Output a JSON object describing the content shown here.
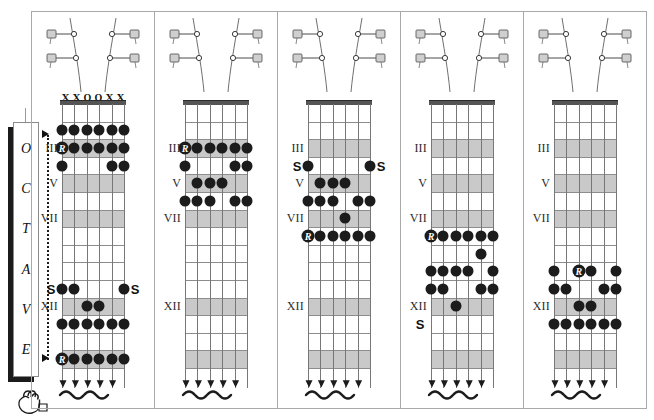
{
  "diagram": {
    "kind": "guitar-fretboard-positions",
    "octave_label": {
      "letters": [
        "O",
        "C",
        "T",
        "A",
        "V",
        "E"
      ],
      "text": "OCTAVE"
    },
    "hand_icon": "pointing-hand-icon",
    "colors": {
      "dot": "#1c1c1c",
      "band": "#c9c9c9",
      "fret": "#8d8d8d",
      "string": "#777777",
      "nut": "#555555",
      "frame": "#a9a9a9",
      "shadow": "#1b1b1b"
    },
    "string_count": 6,
    "fret_count": 15,
    "root_glyph": "R",
    "shift_glyph": "S",
    "panels": [
      {
        "id": "position-1",
        "open_markers": [
          "X",
          "X",
          "O",
          "O",
          "X",
          "X"
        ],
        "fret_numbers": [
          {
            "label": "III",
            "fret": 3
          },
          {
            "label": "V",
            "fret": 5
          },
          {
            "label": "VII",
            "fret": 7
          },
          {
            "label": "XII",
            "fret": 12
          }
        ],
        "bands": [
          3,
          5,
          7,
          12,
          15
        ],
        "dots": [
          {
            "string": 1,
            "fret": 2
          },
          {
            "string": 2,
            "fret": 2
          },
          {
            "string": 3,
            "fret": 2
          },
          {
            "string": 4,
            "fret": 2
          },
          {
            "string": 5,
            "fret": 2
          },
          {
            "string": 6,
            "fret": 2
          },
          {
            "string": 1,
            "fret": 3,
            "root": true
          },
          {
            "string": 2,
            "fret": 3
          },
          {
            "string": 3,
            "fret": 3
          },
          {
            "string": 4,
            "fret": 3
          },
          {
            "string": 5,
            "fret": 3
          },
          {
            "string": 6,
            "fret": 3
          },
          {
            "string": 1,
            "fret": 4
          },
          {
            "string": 5,
            "fret": 4
          },
          {
            "string": 6,
            "fret": 4
          },
          {
            "string": 1,
            "fret": 11
          },
          {
            "string": 2,
            "fret": 11
          },
          {
            "string": 6,
            "fret": 11
          },
          {
            "string": 3,
            "fret": 12
          },
          {
            "string": 4,
            "fret": 12
          },
          {
            "string": 1,
            "fret": 13
          },
          {
            "string": 2,
            "fret": 13
          },
          {
            "string": 3,
            "fret": 13
          },
          {
            "string": 4,
            "fret": 13
          },
          {
            "string": 5,
            "fret": 13
          },
          {
            "string": 6,
            "fret": 13
          },
          {
            "string": 1,
            "fret": 15,
            "root": true
          },
          {
            "string": 2,
            "fret": 15
          },
          {
            "string": 3,
            "fret": 15
          },
          {
            "string": 4,
            "fret": 15
          },
          {
            "string": 5,
            "fret": 15
          },
          {
            "string": 6,
            "fret": 15
          }
        ],
        "s_markers": [
          {
            "side": "left",
            "fret": 11
          },
          {
            "side": "right",
            "fret": 11
          }
        ]
      },
      {
        "id": "position-2",
        "open_markers": [],
        "fret_numbers": [
          {
            "label": "III",
            "fret": 3
          },
          {
            "label": "V",
            "fret": 5
          },
          {
            "label": "VII",
            "fret": 7
          },
          {
            "label": "XII",
            "fret": 12
          }
        ],
        "bands": [
          3,
          5,
          7,
          12,
          15
        ],
        "dots": [
          {
            "string": 1,
            "fret": 3,
            "root": true
          },
          {
            "string": 2,
            "fret": 3
          },
          {
            "string": 3,
            "fret": 3
          },
          {
            "string": 4,
            "fret": 3
          },
          {
            "string": 5,
            "fret": 3
          },
          {
            "string": 6,
            "fret": 3
          },
          {
            "string": 1,
            "fret": 4
          },
          {
            "string": 5,
            "fret": 4
          },
          {
            "string": 6,
            "fret": 4
          },
          {
            "string": 2,
            "fret": 5
          },
          {
            "string": 3,
            "fret": 5
          },
          {
            "string": 4,
            "fret": 5
          },
          {
            "string": 1,
            "fret": 6
          },
          {
            "string": 2,
            "fret": 6
          },
          {
            "string": 3,
            "fret": 6
          },
          {
            "string": 5,
            "fret": 6
          },
          {
            "string": 6,
            "fret": 6
          }
        ],
        "s_markers": []
      },
      {
        "id": "position-3",
        "open_markers": [],
        "fret_numbers": [
          {
            "label": "III",
            "fret": 3
          },
          {
            "label": "V",
            "fret": 5
          },
          {
            "label": "VII",
            "fret": 7
          },
          {
            "label": "XII",
            "fret": 12
          }
        ],
        "bands": [
          3,
          5,
          7,
          12,
          15
        ],
        "dots": [
          {
            "string": 1,
            "fret": 4
          },
          {
            "string": 6,
            "fret": 4
          },
          {
            "string": 2,
            "fret": 5
          },
          {
            "string": 3,
            "fret": 5
          },
          {
            "string": 4,
            "fret": 5
          },
          {
            "string": 1,
            "fret": 6
          },
          {
            "string": 2,
            "fret": 6
          },
          {
            "string": 3,
            "fret": 6
          },
          {
            "string": 5,
            "fret": 6
          },
          {
            "string": 6,
            "fret": 6
          },
          {
            "string": 4,
            "fret": 7
          },
          {
            "string": 1,
            "fret": 8,
            "root": true
          },
          {
            "string": 2,
            "fret": 8
          },
          {
            "string": 3,
            "fret": 8
          },
          {
            "string": 4,
            "fret": 8
          },
          {
            "string": 5,
            "fret": 8
          },
          {
            "string": 6,
            "fret": 8
          }
        ],
        "s_markers": [
          {
            "side": "left",
            "fret": 4
          },
          {
            "side": "right",
            "fret": 4
          }
        ]
      },
      {
        "id": "position-4",
        "open_markers": [],
        "fret_numbers": [
          {
            "label": "III",
            "fret": 3
          },
          {
            "label": "V",
            "fret": 5
          },
          {
            "label": "VII",
            "fret": 7
          },
          {
            "label": "XII",
            "fret": 12
          }
        ],
        "bands": [
          3,
          5,
          7,
          12,
          15
        ],
        "dots": [
          {
            "string": 1,
            "fret": 8,
            "root": true
          },
          {
            "string": 2,
            "fret": 8
          },
          {
            "string": 3,
            "fret": 8
          },
          {
            "string": 4,
            "fret": 8
          },
          {
            "string": 5,
            "fret": 8
          },
          {
            "string": 6,
            "fret": 8
          },
          {
            "string": 5,
            "fret": 9
          },
          {
            "string": 1,
            "fret": 10
          },
          {
            "string": 2,
            "fret": 10
          },
          {
            "string": 3,
            "fret": 10
          },
          {
            "string": 4,
            "fret": 10
          },
          {
            "string": 6,
            "fret": 10
          },
          {
            "string": 1,
            "fret": 11
          },
          {
            "string": 2,
            "fret": 11
          },
          {
            "string": 5,
            "fret": 11
          },
          {
            "string": 6,
            "fret": 11
          },
          {
            "string": 3,
            "fret": 12
          }
        ],
        "s_markers": [
          {
            "side": "left",
            "fret": 13
          }
        ]
      },
      {
        "id": "position-5",
        "open_markers": [],
        "fret_numbers": [
          {
            "label": "III",
            "fret": 3
          },
          {
            "label": "V",
            "fret": 5
          },
          {
            "label": "VII",
            "fret": 7
          },
          {
            "label": "XII",
            "fret": 12
          }
        ],
        "bands": [
          3,
          5,
          7,
          12,
          15
        ],
        "dots": [
          {
            "string": 1,
            "fret": 10
          },
          {
            "string": 3,
            "fret": 10,
            "root": true
          },
          {
            "string": 4,
            "fret": 10
          },
          {
            "string": 6,
            "fret": 10
          },
          {
            "string": 1,
            "fret": 11
          },
          {
            "string": 2,
            "fret": 11
          },
          {
            "string": 5,
            "fret": 11
          },
          {
            "string": 6,
            "fret": 11
          },
          {
            "string": 3,
            "fret": 12
          },
          {
            "string": 4,
            "fret": 12
          },
          {
            "string": 1,
            "fret": 13
          },
          {
            "string": 2,
            "fret": 13
          },
          {
            "string": 3,
            "fret": 13
          },
          {
            "string": 4,
            "fret": 13
          },
          {
            "string": 5,
            "fret": 13
          },
          {
            "string": 6,
            "fret": 13
          }
        ],
        "s_markers": []
      }
    ]
  }
}
